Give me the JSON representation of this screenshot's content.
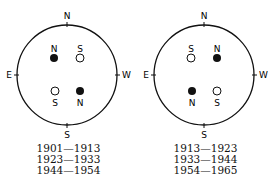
{
  "diagrams": [
    {
      "compass": {
        "top": "N",
        "left": "E",
        "right": "W",
        "bottom": "S"
      },
      "spots": [
        {
          "label": "N",
          "filled": true,
          "pos": "upper-left",
          "label_side": "above"
        },
        {
          "label": "S",
          "filled": false,
          "pos": "upper-right",
          "label_side": "above"
        },
        {
          "label": "S",
          "filled": false,
          "pos": "lower-left",
          "label_side": "below"
        },
        {
          "label": "N",
          "filled": true,
          "pos": "lower-right",
          "label_side": "below"
        }
      ],
      "years": [
        "1901—1913",
        "1923—1933",
        "1944—1954"
      ]
    },
    {
      "compass": {
        "top": "N",
        "left": "E",
        "right": "W",
        "bottom": "S"
      },
      "spots": [
        {
          "label": "S",
          "filled": false,
          "pos": "upper-left",
          "label_side": "above"
        },
        {
          "label": "N",
          "filled": true,
          "pos": "upper-right",
          "label_side": "above"
        },
        {
          "label": "N",
          "filled": true,
          "pos": "lower-left",
          "label_side": "below"
        },
        {
          "label": "S",
          "filled": false,
          "pos": "lower-right",
          "label_side": "below"
        }
      ],
      "years": [
        "1913—1923",
        "1933—1944",
        "1954—1965"
      ]
    }
  ]
}
